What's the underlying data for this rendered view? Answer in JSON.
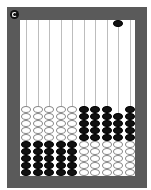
{
  "app": {
    "name": "abacus"
  },
  "colors": {
    "frame": "#5a5a5a",
    "inner": "#ffffff",
    "rod": "#bdbdbd",
    "white_bead": "#ffffff",
    "black_bead": "#111111"
  },
  "controls": {
    "reset_icon": "reset-icon"
  },
  "abacus": {
    "rod_count": 10,
    "columns": [
      {
        "top_black": 0,
        "white": 5,
        "black": 5,
        "order": "white-then-black"
      },
      {
        "top_black": 0,
        "white": 5,
        "black": 5,
        "order": "white-then-black"
      },
      {
        "top_black": 0,
        "white": 5,
        "black": 5,
        "order": "white-then-black"
      },
      {
        "top_black": 0,
        "white": 5,
        "black": 5,
        "order": "white-then-black"
      },
      {
        "top_black": 0,
        "white": 5,
        "black": 5,
        "order": "white-then-black"
      },
      {
        "top_black": 0,
        "white": 5,
        "black": 5,
        "order": "black-then-white"
      },
      {
        "top_black": 0,
        "white": 5,
        "black": 5,
        "order": "black-then-white"
      },
      {
        "top_black": 0,
        "white": 5,
        "black": 5,
        "order": "black-then-white"
      },
      {
        "top_black": 1,
        "white": 5,
        "black": 4,
        "order": "black-then-white"
      },
      {
        "top_black": 0,
        "white": 5,
        "black": 5,
        "order": "black-then-white"
      }
    ]
  }
}
